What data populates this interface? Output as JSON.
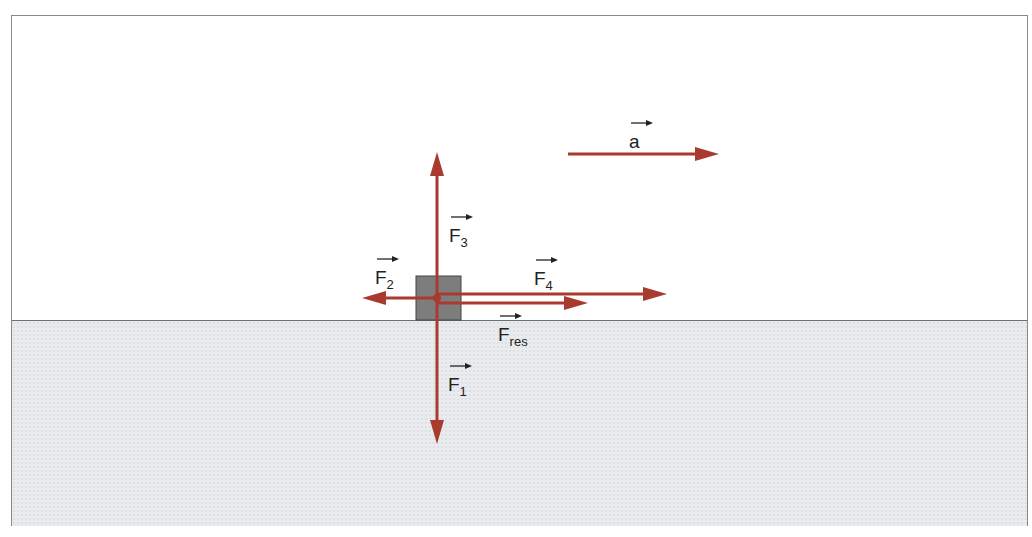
{
  "diagram": {
    "title": "",
    "colors": {
      "arrow": "#a83a2e",
      "block": "#7d7d7d",
      "ground": "#e9ebee",
      "frame": "#8a8a8a",
      "text": "#222222"
    },
    "labels": {
      "a": {
        "base": "a",
        "sub": ""
      },
      "F1": {
        "base": "F",
        "sub": "1"
      },
      "F2": {
        "base": "F",
        "sub": "2"
      },
      "F3": {
        "base": "F",
        "sub": "3"
      },
      "F4": {
        "base": "F",
        "sub": "4"
      },
      "Fres": {
        "base": "F",
        "sub": "res"
      }
    },
    "vectors": [
      {
        "id": "F1",
        "direction": "down"
      },
      {
        "id": "F2",
        "direction": "left"
      },
      {
        "id": "F3",
        "direction": "up"
      },
      {
        "id": "F4",
        "direction": "right"
      },
      {
        "id": "Fres",
        "direction": "right"
      },
      {
        "id": "a",
        "direction": "right"
      }
    ]
  }
}
